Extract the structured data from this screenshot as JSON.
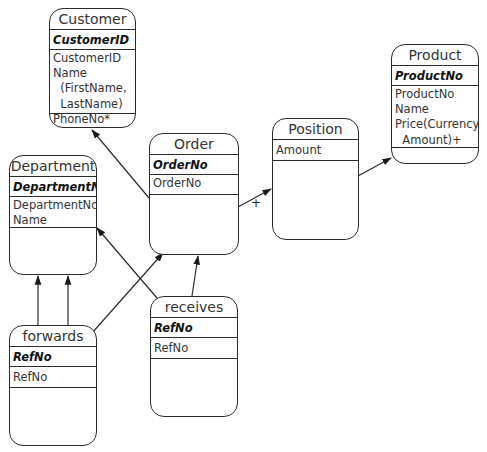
{
  "diagram": {
    "entities": {
      "customer": {
        "title": "Customer",
        "key": "CustomerID",
        "attrs": [
          "CustomerID",
          "Name",
          "  (FirstName,",
          "  LastName)",
          "PhoneNo*"
        ]
      },
      "product": {
        "title": "Product",
        "key": "ProductNo",
        "attrs": [
          "ProductNo",
          "Name",
          "Price(Currency,",
          "  Amount)+"
        ]
      },
      "order": {
        "title": "Order",
        "key": "OrderNo",
        "attrs": [
          "OrderNo"
        ]
      },
      "position": {
        "title": "Position",
        "key": null,
        "attrs": [
          "Amount"
        ]
      },
      "department": {
        "title": "Department",
        "key": "DepartmentNo",
        "attrs": [
          "DepartmentNo",
          "Name"
        ]
      },
      "forwards": {
        "title": "forwards",
        "key": "RefNo",
        "attrs": [
          "RefNo"
        ]
      },
      "receives": {
        "title": "receives",
        "key": "RefNo",
        "attrs": [
          "RefNo"
        ]
      }
    },
    "attr_text": {
      "customer": "CustomerID\nName\n  (FirstName,\n  LastName)\nPhoneNo*",
      "product": "ProductNo\nName\nPrice(Currency,\n  Amount)+",
      "order": "OrderNo",
      "position": "Amount",
      "department": "DepartmentNo\nName",
      "forwards": "RefNo",
      "receives": "RefNo"
    },
    "relationships": [
      {
        "from": "order",
        "to": "customer",
        "label": ""
      },
      {
        "from": "order",
        "to": "position",
        "label": "+"
      },
      {
        "from": "position",
        "to": "product",
        "label": ""
      },
      {
        "from": "receives",
        "to": "department",
        "label": ""
      },
      {
        "from": "receives",
        "to": "order",
        "label": ""
      },
      {
        "from": "forwards",
        "to": "order",
        "label": ""
      },
      {
        "from": "forwards",
        "to": "department",
        "label": ""
      },
      {
        "from": "forwards",
        "to": "department",
        "label": ""
      }
    ],
    "multiplicity_label": "+"
  }
}
